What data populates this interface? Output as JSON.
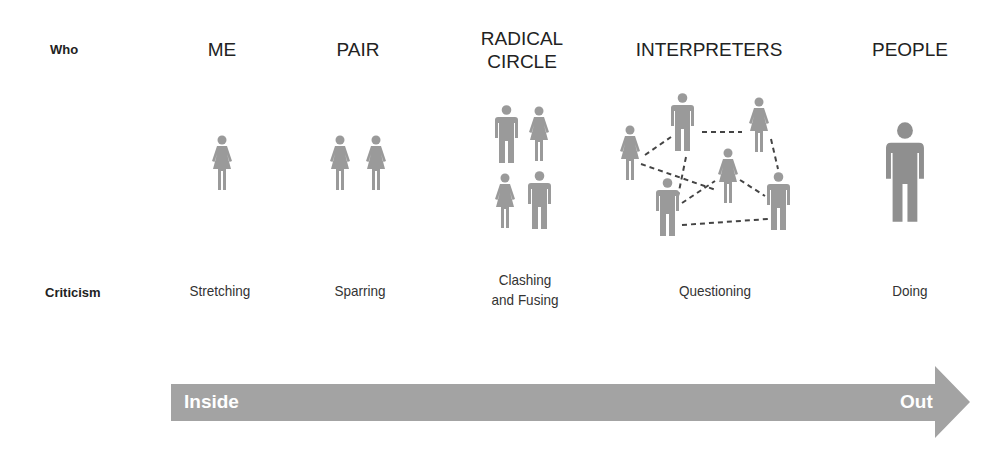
{
  "rows": {
    "who_label": "Who",
    "criticism_label": "Criticism"
  },
  "columns": [
    {
      "title_line1": "ME",
      "title_line2": "",
      "criticism_line1": "Stretching",
      "criticism_line2": "",
      "figures": [
        "woman"
      ]
    },
    {
      "title_line1": "PAIR",
      "title_line2": "",
      "criticism_line1": "Sparring",
      "criticism_line2": "",
      "figures": [
        "woman",
        "woman"
      ]
    },
    {
      "title_line1": "RADICAL",
      "title_line2": "CIRCLE",
      "criticism_line1": "Clashing",
      "criticism_line2": "and Fusing",
      "figures": [
        "man",
        "woman",
        "woman",
        "man"
      ]
    },
    {
      "title_line1": "INTERPRETERS",
      "title_line2": "",
      "criticism_line1": "Questioning",
      "criticism_line2": "",
      "figures": [
        "woman",
        "man",
        "woman",
        "woman",
        "man",
        "man"
      ]
    },
    {
      "title_line1": "PEOPLE",
      "title_line2": "",
      "criticism_line1": "Doing",
      "criticism_line2": "",
      "figures": [
        "man"
      ]
    }
  ],
  "arrow": {
    "start_label": "Inside",
    "end_label": "Out",
    "color": "#a3a3a3"
  },
  "colors": {
    "figure": "#9a9a9a",
    "figure_large": "#8f8f8f",
    "dash_line": "#444444",
    "text": "#222222"
  }
}
